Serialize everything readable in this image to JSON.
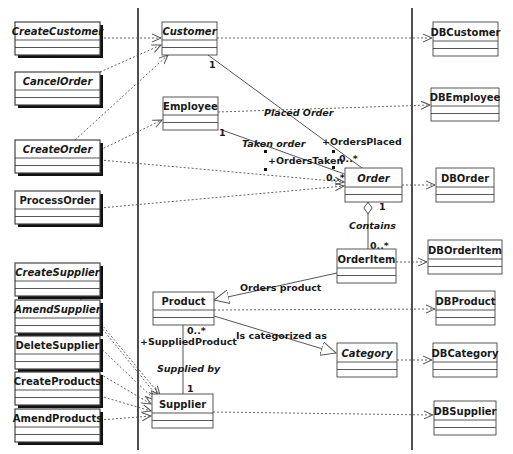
{
  "diagram": {
    "type": "UML class diagram (boundary / entity / persistence layers)",
    "boundary_classes": [
      {
        "name": "CreateCustomer",
        "x": 15,
        "y": 22,
        "w": 85,
        "h": 33,
        "italic": true
      },
      {
        "name": "CancelOrder",
        "x": 15,
        "y": 72,
        "w": 85,
        "h": 33,
        "italic": true
      },
      {
        "name": "CreateOrder",
        "x": 15,
        "y": 140,
        "w": 85,
        "h": 33,
        "italic": true
      },
      {
        "name": "ProcessOrder",
        "x": 15,
        "y": 191,
        "w": 85,
        "h": 33,
        "italic": false
      },
      {
        "name": "CreateSupplier",
        "x": 15,
        "y": 263,
        "w": 85,
        "h": 33,
        "italic": true
      },
      {
        "name": "AmendSupplier",
        "x": 15,
        "y": 300,
        "w": 85,
        "h": 33,
        "italic": true
      },
      {
        "name": "DeleteSupplier",
        "x": 15,
        "y": 336,
        "w": 85,
        "h": 33,
        "italic": false
      },
      {
        "name": "CreateProducts",
        "x": 15,
        "y": 372,
        "w": 85,
        "h": 33,
        "italic": false
      },
      {
        "name": "AmendProducts",
        "x": 15,
        "y": 409,
        "w": 85,
        "h": 33,
        "italic": false
      }
    ],
    "entity_classes": [
      {
        "name": "Customer",
        "x": 162,
        "y": 22,
        "w": 55,
        "h": 33,
        "italic": true
      },
      {
        "name": "Employee",
        "x": 163,
        "y": 97,
        "w": 55,
        "h": 33,
        "italic": false
      },
      {
        "name": "Order",
        "x": 345,
        "y": 168,
        "w": 57,
        "h": 34,
        "italic": true
      },
      {
        "name": "OrderItem",
        "x": 337,
        "y": 249,
        "w": 59,
        "h": 34,
        "italic": false
      },
      {
        "name": "Product",
        "x": 153,
        "y": 292,
        "w": 61,
        "h": 33,
        "italic": false
      },
      {
        "name": "Category",
        "x": 337,
        "y": 343,
        "w": 60,
        "h": 34,
        "italic": true
      },
      {
        "name": "Supplier",
        "x": 152,
        "y": 394,
        "w": 61,
        "h": 34,
        "italic": false
      }
    ],
    "db_classes": [
      {
        "name": "DBCustomer",
        "x": 433,
        "y": 22,
        "w": 65,
        "h": 34
      },
      {
        "name": "DBEmployee",
        "x": 431,
        "y": 88,
        "w": 68,
        "h": 33
      },
      {
        "name": "DBOrder",
        "x": 436,
        "y": 168,
        "w": 58,
        "h": 34
      },
      {
        "name": "DBOrderItem",
        "x": 428,
        "y": 240,
        "w": 74,
        "h": 34
      },
      {
        "name": "DBProduct",
        "x": 436,
        "y": 291,
        "w": 59,
        "h": 34
      },
      {
        "name": "DBCategory",
        "x": 433,
        "y": 343,
        "w": 64,
        "h": 34
      },
      {
        "name": "DBSupplier",
        "x": 434,
        "y": 401,
        "w": 62,
        "h": 34
      }
    ],
    "associations": [
      {
        "from": "Customer",
        "to": "Order",
        "label": "Placed Order",
        "from_mult": "1",
        "to_role": "+OrdersPlaced",
        "to_mult": "0..*"
      },
      {
        "from": "Employee",
        "to": "Order",
        "label": "Taken order",
        "from_mult": "1",
        "to_role": "+OrdersTaken",
        "to_mult": "0..*"
      },
      {
        "from": "Order",
        "to": "OrderItem",
        "label": "Contains",
        "kind": "aggregation",
        "from_mult": "1",
        "to_mult": "0..*"
      },
      {
        "from": "OrderItem",
        "to": "Product",
        "label": "Orders product",
        "kind": "generalization"
      },
      {
        "from": "Product",
        "to": "Category",
        "label": "Is categorized as",
        "kind": "generalization"
      },
      {
        "from": "Product",
        "to": "Supplier",
        "label": "Supplied by",
        "from_role": "+SuppliedProduct",
        "from_mult": "0..*",
        "to_mult": "1"
      }
    ],
    "labels": {
      "placed_order": "Placed Order",
      "taken_order": "Taken order",
      "orders_placed": "+OrdersPlaced",
      "orders_taken": "+OrdersTaken",
      "contains": "Contains",
      "orders_product": "Orders product",
      "is_categorized_as": "Is categorized as",
      "supplied_product": "+SuppliedProduct",
      "supplied_by": "Supplied by",
      "mult_one": "1",
      "mult_many": "0..*"
    },
    "colors": {
      "line": "#555555",
      "box_border": "#444444",
      "shadow": "#111111",
      "background": "#ffffff"
    }
  }
}
